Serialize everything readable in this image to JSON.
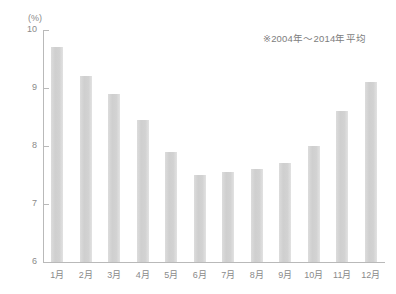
{
  "chart_data": {
    "type": "bar",
    "title": "",
    "subtitle": "",
    "annotation": "※2004年～2014年平均",
    "unit_label": "(%)",
    "xlabel": "",
    "ylabel": "",
    "ylim": [
      6,
      10
    ],
    "yticks": [
      10,
      9,
      8,
      7,
      6
    ],
    "ytick_labels": [
      "10",
      "9",
      "8",
      "7",
      "6"
    ],
    "grid": false,
    "legend": false,
    "categories": [
      "1月",
      "2月",
      "3月",
      "4月",
      "5月",
      "6月",
      "7月",
      "8月",
      "9月",
      "10月",
      "11月",
      "12月"
    ],
    "values": [
      9.7,
      9.2,
      8.9,
      8.45,
      7.9,
      7.5,
      7.55,
      7.6,
      7.7,
      8.0,
      8.6,
      9.1
    ],
    "bar_color": "#d4d4d4",
    "axis_color": "#b9b9b9",
    "text_color": "#8a8a8a",
    "background": "#ffffff"
  }
}
